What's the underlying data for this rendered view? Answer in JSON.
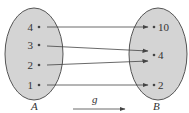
{
  "diagram": {
    "type": "function-mapping",
    "function_name": "g",
    "colors": {
      "ellipse_fill": "#d4d4d4",
      "ellipse_stroke": "#555555",
      "line": "#444444",
      "text": "#333333"
    },
    "domain": {
      "name": "A",
      "elements": [
        {
          "label": "4",
          "x": 39,
          "y": 27
        },
        {
          "label": "3",
          "x": 39,
          "y": 45
        },
        {
          "label": "2",
          "x": 39,
          "y": 65
        },
        {
          "label": "1",
          "x": 39,
          "y": 85
        }
      ]
    },
    "codomain": {
      "name": "B",
      "elements": [
        {
          "label": "10",
          "x": 154,
          "y": 27
        },
        {
          "label": "4",
          "x": 154,
          "y": 55
        },
        {
          "label": "2",
          "x": 154,
          "y": 85
        }
      ]
    },
    "mappings": [
      {
        "from": "4",
        "to": "10",
        "x1": 47,
        "y1": 27,
        "x2": 148,
        "y2": 27
      },
      {
        "from": "3",
        "to": "4",
        "x1": 47,
        "y1": 46,
        "x2": 148,
        "y2": 51
      },
      {
        "from": "2",
        "to": "4",
        "x1": 47,
        "y1": 65,
        "x2": 148,
        "y2": 61
      },
      {
        "from": "1",
        "to": "2",
        "x1": 47,
        "y1": 85,
        "x2": 148,
        "y2": 85
      }
    ]
  }
}
